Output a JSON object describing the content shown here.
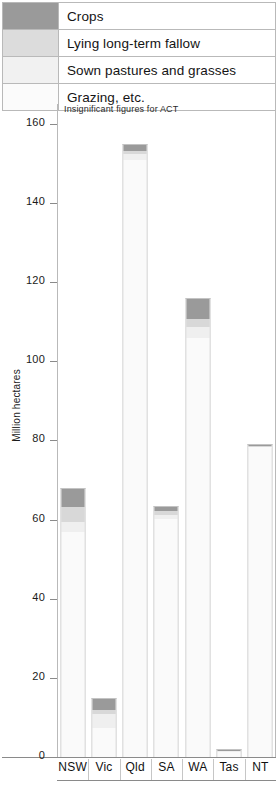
{
  "legend": {
    "items": [
      {
        "label": "Crops",
        "color": "#9a9a9a",
        "key": "crops"
      },
      {
        "label": "Lying long-term fallow",
        "color": "#d8d8d8",
        "key": "fallow"
      },
      {
        "label": "Sown pastures and grasses",
        "color": "#efefef",
        "key": "sown"
      },
      {
        "label": "Grazing, etc.",
        "color": "#fafafa",
        "key": "grazing"
      }
    ]
  },
  "note": "Insignificant figures for ACT",
  "chart_data": {
    "type": "bar",
    "subtype": "stacked",
    "title": "",
    "xlabel": "",
    "ylabel": "Million hectares",
    "ylim": [
      0,
      165
    ],
    "yticks": [
      0,
      20,
      40,
      60,
      80,
      100,
      120,
      140,
      160
    ],
    "ytick_labels": [
      "0",
      "20",
      "40",
      "60",
      "80",
      "100",
      "120",
      "140",
      "160"
    ],
    "grid": false,
    "legend_position": "top",
    "annotation": "Insignificant figures for ACT",
    "categories": [
      "NSW",
      "Vic",
      "Qld",
      "SA",
      "WA",
      "Tas",
      "NT"
    ],
    "series": [
      {
        "name": "Grazing, etc.",
        "color": "#fafafa",
        "values": [
          57,
          7.5,
          151,
          60.5,
          106,
          1.4,
          78.5
        ]
      },
      {
        "name": "Sown pastures and grasses",
        "color": "#efefef",
        "values": [
          2.5,
          3.5,
          1.5,
          1.0,
          3.0,
          0.3,
          0.2
        ]
      },
      {
        "name": "Lying long-term fallow",
        "color": "#d8d8d8",
        "values": [
          4.0,
          1.0,
          0.8,
          0.8,
          2.0,
          0.1,
          0.1
        ]
      },
      {
        "name": "Crops",
        "color": "#9a9a9a",
        "values": [
          4.5,
          3.0,
          1.7,
          1.2,
          5.0,
          0.2,
          0.2
        ]
      }
    ],
    "totals": [
      68,
      15,
      155,
      63.5,
      116,
      2,
      79
    ]
  },
  "xaxis": {
    "labels": [
      "NSW",
      "Vic",
      "Qld",
      "SA",
      "WA",
      "Tas",
      "NT"
    ]
  }
}
